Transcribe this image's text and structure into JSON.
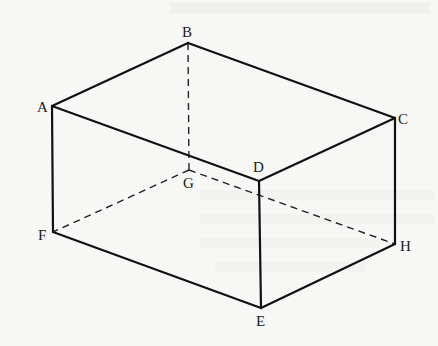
{
  "diagram": {
    "type": "3D rectangular box (oblique/isometric view) with hidden edges dashed",
    "colors": {
      "background": "#f7f7f6",
      "line": "#111111"
    },
    "vertices": {
      "A": {
        "x": 52,
        "y": 106,
        "label": "A"
      },
      "B": {
        "x": 188,
        "y": 43,
        "label": "B"
      },
      "C": {
        "x": 395,
        "y": 118,
        "label": "C"
      },
      "D": {
        "x": 259,
        "y": 181,
        "label": "D"
      },
      "E": {
        "x": 261,
        "y": 308,
        "label": "E"
      },
      "F": {
        "x": 53,
        "y": 232,
        "label": "F"
      },
      "G": {
        "x": 189,
        "y": 170,
        "label": "G"
      },
      "H": {
        "x": 395,
        "y": 244,
        "label": "H"
      }
    },
    "visible_edges": [
      "AB",
      "BC",
      "CD",
      "DA",
      "AF",
      "DE",
      "CH",
      "FE",
      "EH"
    ],
    "hidden_edges": [
      "BG",
      "GF",
      "GH"
    ]
  }
}
